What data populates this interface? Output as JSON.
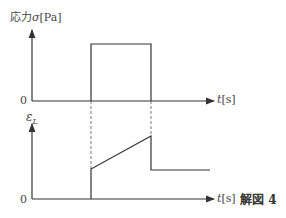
{
  "figure": {
    "caption": "解図 4",
    "top_plot": {
      "y_label_text": "応力",
      "y_label_symbol": "σ",
      "y_label_unit": "[Pa]",
      "origin_label": "0",
      "x_label_symbol": "t",
      "x_label_unit": "[s]",
      "description": "rectangular stress pulse applied at t1 and removed at t2"
    },
    "bottom_plot": {
      "y_label_symbol": "ε",
      "y_label_subscript": "L",
      "origin_label": "0",
      "x_label_symbol": "t",
      "x_label_unit": "[s]",
      "description": "instant elastic strain jump at t1, linear creep until t2, instant partial recovery, then constant residual strain"
    },
    "line_color": "#333333"
  }
}
